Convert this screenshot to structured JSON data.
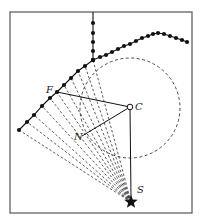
{
  "diagram": {
    "frame": {
      "x": 10,
      "y": 12,
      "width": 182,
      "height": 201,
      "stroke": "#555555"
    },
    "colors": {
      "ink": "#111111",
      "dash": "#333333",
      "frame": "#555555"
    },
    "labels": {
      "F": "F",
      "C": "C",
      "N": "N",
      "S": "S"
    },
    "points": {
      "F": [
        57,
        92
      ],
      "C": [
        130,
        107
      ],
      "N": [
        82,
        136
      ],
      "S": [
        131,
        202
      ]
    },
    "circle": {
      "cx": 130,
      "cy": 108,
      "r": 50,
      "style": "dashed"
    },
    "vertical_chain": [
      [
        93,
        12
      ],
      [
        93,
        23
      ],
      [
        93,
        33
      ],
      [
        93,
        42
      ],
      [
        93,
        51
      ],
      [
        93,
        60
      ]
    ],
    "right_chain": [
      [
        93,
        60
      ],
      [
        100,
        57
      ],
      [
        106,
        55
      ],
      [
        112,
        52
      ],
      [
        118,
        49
      ],
      [
        124,
        46
      ],
      [
        130,
        44
      ],
      [
        136,
        41
      ],
      [
        142,
        38
      ],
      [
        148,
        36
      ],
      [
        153,
        34
      ],
      [
        158,
        33
      ],
      [
        164,
        34
      ],
      [
        170,
        36
      ],
      [
        176,
        38
      ],
      [
        182,
        40
      ],
      [
        187,
        42
      ]
    ],
    "left_chain": [
      [
        93,
        60
      ],
      [
        85,
        66
      ],
      [
        78,
        71
      ],
      [
        71,
        78
      ],
      [
        64,
        85
      ],
      [
        57,
        92
      ],
      [
        50,
        98
      ],
      [
        42,
        106
      ],
      [
        34,
        115
      ],
      [
        27,
        122
      ],
      [
        19,
        130
      ]
    ]
  }
}
